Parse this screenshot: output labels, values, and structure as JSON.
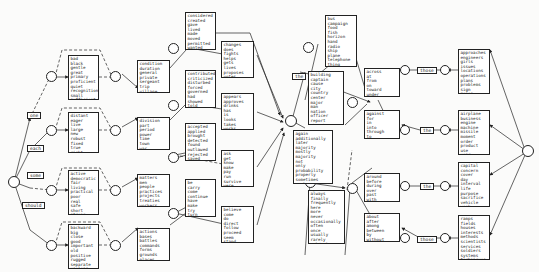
{
  "diagram": {
    "type": "sentence-generation transition network",
    "start_labels": [
      "one",
      "each",
      "some",
      "should"
    ],
    "column1_boxes": [
      {
        "id": "adj1",
        "words": [
          "bad",
          "black",
          "gentle",
          "great",
          "primary",
          "proficient",
          "quiet",
          "recognition",
          "small",
          "sufficient"
        ]
      },
      {
        "id": "adj2",
        "words": [
          "distant",
          "eager",
          "live",
          "large",
          "new",
          "robust",
          "fixed",
          "true",
          "right"
        ]
      },
      {
        "id": "adj3",
        "words": [
          "active",
          "democratic",
          "fair",
          "living",
          "practical",
          "poor",
          "real",
          "safe",
          "short",
          "strong"
        ]
      },
      {
        "id": "adj4",
        "words": [
          "backward",
          "big",
          "close",
          "good",
          "important",
          "old",
          "positive",
          "rugged",
          "separate",
          "useless"
        ]
      }
    ],
    "column2_boxes": [
      {
        "id": "noun1",
        "words": [
          "condition",
          "duration",
          "general",
          "private",
          "sergeant",
          "trip",
          "village"
        ]
      },
      {
        "id": "noun2",
        "words": [
          "division",
          "part",
          "period",
          "power",
          "time",
          "town",
          "war"
        ]
      },
      {
        "id": "noun3",
        "words": [
          "matters",
          "men",
          "people",
          "practices",
          "projects",
          "treaties",
          "workers"
        ]
      },
      {
        "id": "noun4",
        "words": [
          "actions",
          "bases",
          "battles",
          "commands",
          "forms",
          "grounds",
          "places"
        ]
      }
    ],
    "column3_boxes": [
      {
        "id": "verb1",
        "words": [
          "considered",
          "created",
          "gave",
          "lived",
          "made",
          "moved",
          "permitted",
          "wanted"
        ]
      },
      {
        "id": "verb2",
        "words": [
          "contributed",
          "criticized",
          "disturbed",
          "forced",
          "governed",
          "had",
          "showed",
          "told"
        ]
      },
      {
        "id": "verb3",
        "words": [
          "accepted",
          "applied",
          "brought",
          "detected",
          "found",
          "outlawed",
          "rejected",
          "saved"
        ]
      },
      {
        "id": "verb4",
        "words": [
          "be",
          "carry",
          "come",
          "continue",
          "have",
          "make",
          "try",
          "turn"
        ]
      }
    ],
    "column4_boxes": [
      {
        "id": "verb5",
        "words": [
          "changes",
          "does",
          "fights",
          "helps",
          "gets",
          "lives",
          "proposes",
          "votes"
        ]
      },
      {
        "id": "verb6",
        "words": [
          "appears",
          "approves",
          "drinks",
          "has",
          "is",
          "looks",
          "takes",
          "works"
        ]
      },
      {
        "id": "verb7",
        "words": [
          "ask",
          "get",
          "know",
          "make",
          "pay",
          "run",
          "survive",
          "were"
        ]
      },
      {
        "id": "verb8",
        "words": [
          "believe",
          "come",
          "do",
          "direct",
          "follow",
          "proceed",
          "seem",
          "stand"
        ]
      }
    ],
    "the_label": "the",
    "column5_boxes": [
      {
        "id": "noun5",
        "words": [
          "bus",
          "campaign",
          "food",
          "fish",
          "horizon",
          "hand",
          "radio",
          "ship",
          "plane",
          "telephone",
          "thing",
          "weapon"
        ]
      },
      {
        "id": "noun6",
        "words": [
          "building",
          "captain",
          "cause",
          "city",
          "country",
          "center",
          "major",
          "man",
          "nation",
          "officer",
          "report",
          "thought"
        ]
      },
      {
        "id": "adv1",
        "words": [
          "again",
          "additionally",
          "later",
          "majority",
          "mostly",
          "majority",
          "not",
          "only",
          "probability",
          "properly",
          "sometimes",
          "truly"
        ]
      },
      {
        "id": "adv2",
        "words": [
          "always",
          "finally",
          "frequently",
          "here",
          "more",
          "never",
          "occasionally",
          "often",
          "once",
          "usually",
          "rarely",
          "seldomly"
        ]
      }
    ],
    "column6_boxes": [
      {
        "id": "prep1",
        "words": [
          "across",
          "at",
          "from",
          "on",
          "toward",
          "under"
        ]
      },
      {
        "id": "prep2",
        "words": [
          "against",
          "for",
          "in",
          "into",
          "through",
          "to"
        ]
      },
      {
        "id": "prep3",
        "words": [
          "around",
          "before",
          "during",
          "over",
          "past",
          "with"
        ]
      },
      {
        "id": "prep4",
        "words": [
          "about",
          "after",
          "among",
          "between",
          "by",
          "without"
        ]
      }
    ],
    "determiners": [
      "those",
      "the",
      "the",
      "those"
    ],
    "column7_boxes": [
      {
        "id": "noun7",
        "words": [
          "approaches",
          "engineers",
          "girls",
          "issues",
          "locations",
          "operations",
          "plans",
          "problems",
          "sign",
          "zones"
        ]
      },
      {
        "id": "noun8",
        "words": [
          "airplane",
          "business",
          "engine",
          "machine",
          "missile",
          "moment",
          "order",
          "product",
          "use",
          "year"
        ]
      },
      {
        "id": "noun9",
        "words": [
          "capital",
          "concern",
          "cover",
          "day",
          "interval",
          "life",
          "purpose",
          "sacrifice",
          "vehicle",
          "week"
        ]
      },
      {
        "id": "noun10",
        "words": [
          "ramps",
          "fields",
          "houses",
          "interests",
          "methods",
          "scientists",
          "services",
          "soldiers",
          "systems",
          "techniques"
        ]
      }
    ]
  }
}
